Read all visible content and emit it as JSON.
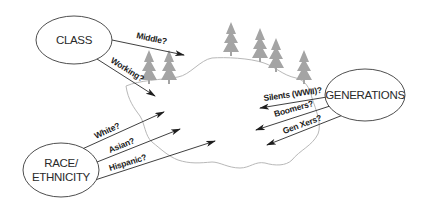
{
  "diagram": {
    "nodes": [
      {
        "id": "class",
        "label_lines": [
          "CLASS"
        ]
      },
      {
        "id": "generations",
        "label_lines": [
          "GENERATIONS"
        ]
      },
      {
        "id": "race",
        "label_lines": [
          "RACE/",
          "ETHNICITY"
        ]
      }
    ],
    "edges": {
      "class": [
        "Middle?",
        "Working?"
      ],
      "generations": [
        "Silents (WWII)?",
        "Boomers?",
        "Gen Xers?"
      ],
      "race": [
        "White?",
        "Asian?",
        "Hispanic?"
      ]
    },
    "landscape": {
      "trees": 6,
      "region": "irregular-blob"
    },
    "colors": {
      "lines": "#2a2a2a",
      "blob_outline": "#b8b8b8",
      "trees": "#a4a4a4",
      "background": "#ffffff"
    }
  }
}
